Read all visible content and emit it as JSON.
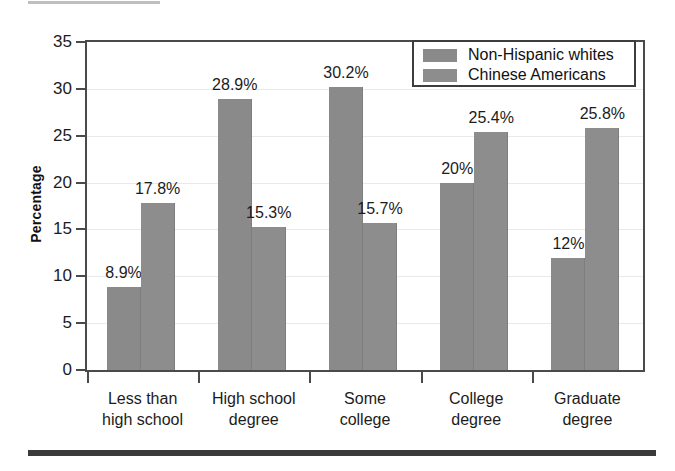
{
  "chart_data": {
    "type": "bar",
    "title": "",
    "xlabel": "",
    "ylabel": "Percentage",
    "ylim": [
      0,
      35
    ],
    "ytick_step": 5,
    "yticks": [
      "35",
      "30",
      "25",
      "20",
      "15",
      "10",
      "5",
      "0"
    ],
    "grid": true,
    "legend_position": "top-right",
    "categories": [
      "Less than high school",
      "High school degree",
      "Some college",
      "College degree",
      "Graduate degree"
    ],
    "category_lines": [
      [
        "Less than",
        "high school"
      ],
      [
        "High school",
        "degree"
      ],
      [
        "Some",
        "college"
      ],
      [
        "College",
        "degree"
      ],
      [
        "Graduate",
        "degree"
      ]
    ],
    "series": [
      {
        "name": "Non-Hispanic whites",
        "color": "#8a8a8a",
        "values": [
          8.9,
          28.9,
          30.2,
          20,
          12
        ],
        "labels": [
          "8.9%",
          "28.9%",
          "30.2%",
          "20%",
          "12%"
        ]
      },
      {
        "name": "Chinese Americans",
        "color": "#8d8d8d",
        "values": [
          17.8,
          15.3,
          15.7,
          25.4,
          25.8
        ],
        "labels": [
          "17.8%",
          "15.3%",
          "15.7%",
          "25.4%",
          "25.8%"
        ]
      }
    ]
  },
  "legend": {
    "entries": [
      {
        "label": "Non-Hispanic whites",
        "swatch": "#8a8a8a"
      },
      {
        "label": "Chinese Americans",
        "swatch": "#8d8d8d"
      }
    ]
  },
  "axis": {
    "y_title": "Percentage"
  }
}
